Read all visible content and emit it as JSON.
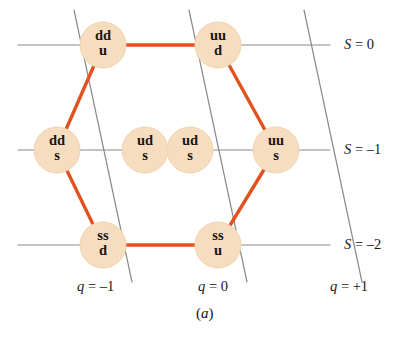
{
  "figure": {
    "caption": "(a)",
    "caption_open": "(",
    "caption_letter": "a",
    "caption_close": ")"
  },
  "colors": {
    "node_fill": "#f7ddc0",
    "node_fill_edge": "#f2d3b0",
    "hexagon_line": "#e3511e",
    "axis_line": "#8a8a8a",
    "text": "#1a1410",
    "background": "#ffffff"
  },
  "nodes": [
    {
      "id": "ddu",
      "quarks_top": "dd",
      "quarks_bottom": "u",
      "cx": 103,
      "cy": 45,
      "r": 23,
      "strangeness": "S = 0",
      "charge": "q = -1"
    },
    {
      "id": "uud",
      "quarks_top": "uu",
      "quarks_bottom": "d",
      "cx": 218,
      "cy": 45,
      "r": 23,
      "strangeness": "S = 0",
      "charge": "q = 0"
    },
    {
      "id": "dds",
      "quarks_top": "dd",
      "quarks_bottom": "s",
      "cx": 57,
      "cy": 150,
      "r": 23,
      "strangeness": "S = -1",
      "charge": "q = -1"
    },
    {
      "id": "uds-1",
      "quarks_top": "ud",
      "quarks_bottom": "s",
      "cx": 145,
      "cy": 150,
      "r": 23,
      "strangeness": "S = -1",
      "charge": "q = 0"
    },
    {
      "id": "uds-2",
      "quarks_top": "ud",
      "quarks_bottom": "s",
      "cx": 190,
      "cy": 150,
      "r": 23,
      "strangeness": "S = -1",
      "charge": "q = 0"
    },
    {
      "id": "uus",
      "quarks_top": "uu",
      "quarks_bottom": "s",
      "cx": 276,
      "cy": 150,
      "r": 23,
      "strangeness": "S = -1",
      "charge": "q = +1"
    },
    {
      "id": "ssd",
      "quarks_top": "ss",
      "quarks_bottom": "d",
      "cx": 103,
      "cy": 245,
      "r": 23,
      "strangeness": "S = -2",
      "charge": "q = -1"
    },
    {
      "id": "ssu",
      "quarks_top": "ss",
      "quarks_bottom": "u",
      "cx": 218,
      "cy": 245,
      "r": 23,
      "strangeness": "S = -2",
      "charge": "q = 0"
    }
  ],
  "strangeness_axis": {
    "name": "strangeness",
    "symbol": "S",
    "rows": [
      {
        "id": "s0",
        "label_symbol": "S",
        "label_eq": " = ",
        "label_value": "0",
        "label": "S = 0",
        "y": 45,
        "x_start": 18,
        "x_end": 330,
        "label_x": 344,
        "label_y": 36
      },
      {
        "id": "sm1",
        "label_symbol": "S",
        "label_eq": " = ",
        "label_value": "–1",
        "label": "S = -1",
        "y": 150,
        "x_start": 18,
        "x_end": 330,
        "label_x": 344,
        "label_y": 141
      },
      {
        "id": "sm2",
        "label_symbol": "S",
        "label_eq": " = ",
        "label_value": "–2",
        "label": "S = -2",
        "y": 245,
        "x_start": 18,
        "x_end": 330,
        "label_x": 344,
        "label_y": 236
      }
    ]
  },
  "charge_axis": {
    "name": "charge",
    "symbol": "q",
    "columns": [
      {
        "id": "qm1",
        "label_symbol": "q",
        "label_eq": " = ",
        "label_value": "–1",
        "label": "q = -1",
        "label_x": 77,
        "label_y": 278,
        "x_top": 74,
        "y_top": 10,
        "x_bottom": 132,
        "y_bottom": 282
      },
      {
        "id": "q0",
        "label_symbol": "q",
        "label_eq": " = ",
        "label_value": "0",
        "label": "q = 0",
        "label_x": 198,
        "label_y": 278,
        "x_top": 189,
        "y_top": 10,
        "x_bottom": 247,
        "y_bottom": 282
      },
      {
        "id": "qp1",
        "label_symbol": "q",
        "label_eq": " = ",
        "label_value": "+1",
        "label": "q = +1",
        "label_x": 330,
        "label_y": 278,
        "x_top": 304,
        "y_top": 10,
        "x_bottom": 362,
        "y_bottom": 282
      }
    ]
  },
  "hexagon_edges": [
    {
      "id": "edge-ddu-uud",
      "from": "ddu",
      "to": "uud"
    },
    {
      "id": "edge-uud-uus",
      "from": "uud",
      "to": "uus"
    },
    {
      "id": "edge-uus-ssu",
      "from": "uus",
      "to": "ssu"
    },
    {
      "id": "edge-ssu-ssd",
      "from": "ssu",
      "to": "ssd"
    },
    {
      "id": "edge-ssd-dds",
      "from": "ssd",
      "to": "dds"
    },
    {
      "id": "edge-dds-ddu",
      "from": "dds",
      "to": "ddu"
    }
  ]
}
